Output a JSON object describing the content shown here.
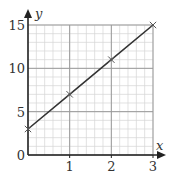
{
  "chart_data": {
    "type": "line",
    "title": "",
    "xlabel": "x",
    "ylabel": "y",
    "xlim": [
      0,
      3
    ],
    "ylim": [
      0,
      15
    ],
    "x_ticks": [
      1,
      2,
      3
    ],
    "y_ticks": [
      0,
      5,
      10,
      15
    ],
    "x_tick_labels": [
      "1",
      "2",
      "3"
    ],
    "y_tick_labels": [
      "0",
      "5",
      "10",
      "15"
    ],
    "grid": true,
    "minor_grid": {
      "x_step": 0.2,
      "y_step": 1
    },
    "series": [
      {
        "name": "y = 4x + 3",
        "x": [
          0,
          1,
          2,
          3
        ],
        "y": [
          3,
          7,
          11,
          15
        ],
        "marker": "x",
        "color": "#333333"
      }
    ]
  },
  "colors": {
    "axis": "#222222",
    "major_grid": "#9a9a9a",
    "minor_grid": "#d6d6d6",
    "line": "#333333"
  }
}
